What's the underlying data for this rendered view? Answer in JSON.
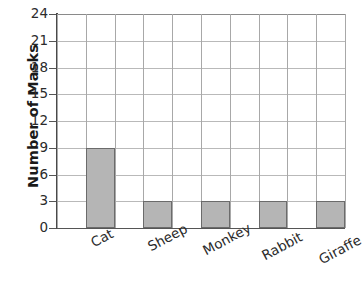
{
  "chart_data": {
    "type": "bar",
    "title": "",
    "subtitle": "",
    "xlabel": "",
    "ylabel": "Number of Masks",
    "categories": [
      "Cat",
      "Sheep",
      "Monkey",
      "Rabbit",
      "Giraffe"
    ],
    "values": [
      9,
      3,
      3,
      3,
      3
    ],
    "series": [
      {
        "name": "Number of Masks",
        "values": [
          9,
          3,
          3,
          3,
          3
        ]
      }
    ],
    "ylim": [
      0,
      24
    ],
    "y_ticks": [
      0,
      3,
      6,
      9,
      12,
      15,
      18,
      21,
      24
    ],
    "y_tick_labels": [
      "0",
      "3",
      "6",
      "9",
      "12",
      "15",
      "18",
      "21",
      "24"
    ],
    "grid": "horizontal-and-vertical",
    "legend": "none",
    "legend_position": "none",
    "x_tick_label_rotation_degrees": -28,
    "bar_count": 5,
    "grid_columns": 10,
    "colors": {
      "bar_fill": "#b5b5b5",
      "bar_border": "#6b6b6b",
      "gridline": "#b9b9b9",
      "gridline_vertical": "#a8a8a8",
      "axis": "#4a4a4a",
      "background": "#ffffff",
      "text": "#2b2b2b",
      "axis_title_text": "#1a1a1a"
    }
  },
  "axis": {
    "y_title": "Number of Masks"
  }
}
